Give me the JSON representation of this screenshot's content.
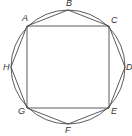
{
  "diagram": {
    "type": "geometry",
    "colors": {
      "stroke": "#4a4a4a",
      "label": "#333333",
      "background": "#ffffff"
    },
    "circle": {
      "cx": 68,
      "cy": 67,
      "r": 57
    },
    "points": [
      {
        "name": "A",
        "x": 27,
        "y": 26,
        "lx": 22,
        "ly": 21
      },
      {
        "name": "B",
        "x": 68,
        "y": 10,
        "lx": 66,
        "ly": 6
      },
      {
        "name": "C",
        "x": 109,
        "y": 26,
        "lx": 111,
        "ly": 23
      },
      {
        "name": "D",
        "x": 125,
        "y": 67,
        "lx": 126,
        "ly": 70
      },
      {
        "name": "E",
        "x": 109,
        "y": 108,
        "lx": 111,
        "ly": 114
      },
      {
        "name": "F",
        "x": 68,
        "y": 124,
        "lx": 65,
        "ly": 133
      },
      {
        "name": "G",
        "x": 27,
        "y": 108,
        "lx": 18,
        "ly": 114
      },
      {
        "name": "H",
        "x": 11,
        "y": 67,
        "lx": 3,
        "ly": 70
      }
    ],
    "square": [
      "A",
      "C",
      "E",
      "G"
    ],
    "octagon": [
      "A",
      "B",
      "C",
      "D",
      "E",
      "F",
      "G",
      "H"
    ],
    "labels": {
      "A": "A",
      "B": "B",
      "C": "C",
      "D": "D",
      "E": "E",
      "F": "F",
      "G": "G",
      "H": "H"
    }
  }
}
